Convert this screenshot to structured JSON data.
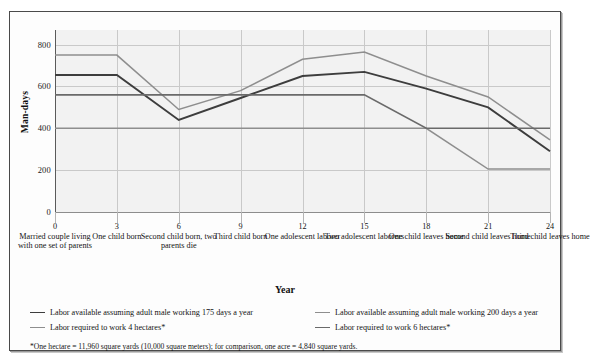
{
  "figure": {
    "y_axis_title": "Man-days",
    "x_axis_title": "Year",
    "footnote": "*One hectare = 11,960 square yards (10,000 square meters); for comparison, one acre = 4,840 square yards."
  },
  "chart_data": {
    "type": "line",
    "title": "",
    "xlabel": "Year",
    "ylabel": "Man-days",
    "ylim": [
      0,
      870
    ],
    "yticks": [
      0,
      200,
      400,
      600,
      800
    ],
    "ytick_labels": [
      "0",
      "200",
      "400",
      "600",
      "800"
    ],
    "grid": true,
    "legend_position": "bottom",
    "x": [
      0,
      3,
      6,
      9,
      12,
      15,
      18,
      21,
      24
    ],
    "xtick_labels": [
      "0",
      "3",
      "6",
      "9",
      "12",
      "15",
      "18",
      "21",
      "24"
    ],
    "xtick_captions": [
      "Married couple living with one set of parents",
      "One child born",
      "Second child born, two parents die",
      "Third child born",
      "One adolescent laborer",
      "Two adolescent laborers",
      "One child leaves home",
      "Second child leaves home",
      "Third child leaves home"
    ],
    "series": [
      {
        "name": "Labor available assuming adult male working 175 days a year",
        "color": "#3d3d3d",
        "width": 1.9,
        "step": false,
        "values": [
          655,
          655,
          440,
          545,
          650,
          670,
          590,
          500,
          290
        ]
      },
      {
        "name": "Labor available assuming adult male working 200 days a year",
        "color": "#8e8e8e",
        "width": 1.5,
        "step": false,
        "values": [
          750,
          750,
          490,
          580,
          730,
          765,
          650,
          550,
          345
        ]
      },
      {
        "name": "Labor required to work 4 hectares*",
        "color": "#8e8e8e",
        "width": 1.5,
        "step": true,
        "values": [
          400,
          400,
          400,
          400,
          400,
          400,
          400,
          205,
          205
        ]
      },
      {
        "name": "Labor required to work 6 hectares*",
        "color": "#6a6a6a",
        "width": 1.6,
        "step": true,
        "values": [
          560,
          560,
          560,
          560,
          560,
          560,
          400,
          400,
          400
        ]
      }
    ]
  },
  "legend": {
    "rows": [
      {
        "left": {
          "label": "Labor available assuming adult male working 175 days a year",
          "color": "#3d3d3d"
        },
        "right": {
          "label": "Labor available assuming adult male working 200 days a year",
          "color": "#8e8e8e"
        }
      },
      {
        "left": {
          "label": "Labor required to work 4 hectares*",
          "color": "#8e8e8e"
        },
        "right": {
          "label": "Labor required to work 6 hectares*",
          "color": "#6a6a6a"
        }
      }
    ]
  }
}
